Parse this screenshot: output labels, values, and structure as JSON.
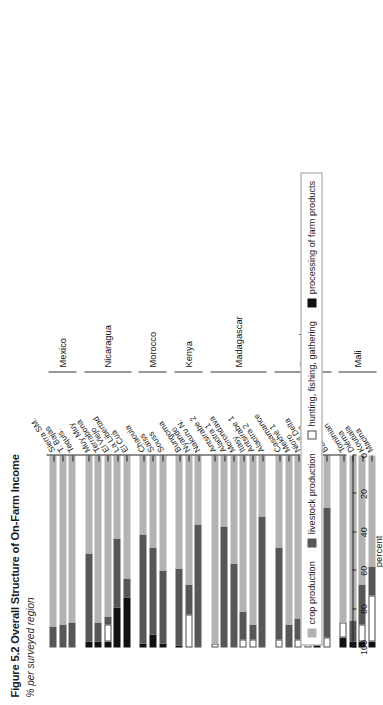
{
  "figure": {
    "title": "Figure 5.2  Overall Structure of On-Farm Income",
    "subtitle": "% per surveyed region"
  },
  "legend": {
    "items": [
      {
        "key": "crop",
        "label": "crop production",
        "color": "#b3b3b3"
      },
      {
        "key": "live",
        "label": "livestock production",
        "color": "#575757"
      },
      {
        "key": "hunt",
        "label": "hunting, fishing, gathering",
        "color": "#ffffff"
      },
      {
        "key": "proc",
        "label": "processing of farm products",
        "color": "#111111"
      }
    ]
  },
  "chart_data": {
    "type": "bar",
    "orientation": "horizontal-stacked",
    "title": "Figure 5.2  Overall Structure of On-Farm Income",
    "subtitle": "% per surveyed region",
    "xlabel": "percent",
    "ylabel": "",
    "xlim": [
      100,
      0
    ],
    "xticks": [
      100,
      80,
      60,
      40,
      20,
      0
    ],
    "x_axis_reversed": true,
    "grid": false,
    "legend_position": "bottom-left",
    "series": [
      {
        "name": "processing of farm products",
        "key": "proc",
        "color": "#111111"
      },
      {
        "name": "hunting, fishing, gathering",
        "key": "hunt",
        "color": "#ffffff"
      },
      {
        "name": "livestock production",
        "key": "live",
        "color": "#575757"
      },
      {
        "name": "crop production",
        "key": "crop",
        "color": "#b3b3b3"
      }
    ],
    "groups": [
      {
        "country": "Mexico",
        "regions": [
          {
            "label": "Sierra SM.",
            "proc": 0,
            "hunt": 0,
            "live": 11,
            "crop": 89
          },
          {
            "label": "T. Bajas",
            "proc": 0,
            "hunt": 0,
            "live": 12,
            "crop": 88
          },
          {
            "label": "Tequis.",
            "proc": 0,
            "hunt": 0,
            "live": 13,
            "crop": 87
          }
        ]
      },
      {
        "country": "Nicaragua",
        "regions": [
          {
            "label": "Muy Muy",
            "proc": 3,
            "hunt": 0,
            "live": 46,
            "crop": 51
          },
          {
            "label": "Terrabona",
            "proc": 3,
            "hunt": 0,
            "live": 10,
            "crop": 87
          },
          {
            "label": "El Viejo",
            "proc": 3,
            "hunt": 9,
            "live": 4,
            "crop": 84
          },
          {
            "label": "La Libertad",
            "proc": 21,
            "hunt": 0,
            "live": 36,
            "crop": 43
          },
          {
            "label": "El Cuá",
            "proc": 26,
            "hunt": 0,
            "live": 10,
            "crop": 64
          }
        ]
      },
      {
        "country": "Morocco",
        "regions": [
          {
            "label": "Chaouia",
            "proc": 2,
            "hunt": 0,
            "live": 57,
            "crop": 41
          },
          {
            "label": "Saïss",
            "proc": 7,
            "hunt": 0,
            "live": 45,
            "crop": 48
          },
          {
            "label": "Souss",
            "proc": 2,
            "hunt": 0,
            "live": 38,
            "crop": 60
          }
        ]
      },
      {
        "country": "Kenya",
        "regions": [
          {
            "label": "Bungoma",
            "proc": 1,
            "hunt": 0,
            "live": 40,
            "crop": 59
          },
          {
            "label": "Nyando",
            "proc": 0,
            "hunt": 17,
            "live": 16,
            "crop": 67
          },
          {
            "label": "Nakuru N.",
            "proc": 0,
            "hunt": 0,
            "live": 64,
            "crop": 36
          }
        ]
      },
      {
        "country": "Madagascar",
        "regions": [
          {
            "label": "Antsirabe 2",
            "proc": 0,
            "hunt": 2,
            "live": 0,
            "crop": 98
          },
          {
            "label": "Alaotra 1",
            "proc": 0,
            "hunt": 0,
            "live": 63,
            "crop": 37
          },
          {
            "label": "Morondava",
            "proc": 0,
            "hunt": 0,
            "live": 44,
            "crop": 56
          },
          {
            "label": "Itasy",
            "proc": 0,
            "hunt": 4,
            "live": 15,
            "crop": 81
          },
          {
            "label": "Antsirabe 1",
            "proc": 0,
            "hunt": 4,
            "live": 8,
            "crop": 88
          },
          {
            "label": "Alaotra 2",
            "proc": 0,
            "hunt": 0,
            "live": 68,
            "crop": 32
          }
        ]
      },
      {
        "country": "Senegal",
        "regions": [
          {
            "label": "Casamance",
            "proc": 0,
            "hunt": 4,
            "live": 48,
            "crop": 48
          },
          {
            "label": "Mekhé 1",
            "proc": 0,
            "hunt": 0,
            "live": 12,
            "crop": 88
          },
          {
            "label": "Nioro",
            "proc": 0,
            "hunt": 4,
            "live": 11,
            "crop": 85
          },
          {
            "label": "Haut Delta",
            "proc": 0,
            "hunt": 6,
            "live": 24,
            "crop": 70
          },
          {
            "label": "Mekhé 2",
            "proc": 13,
            "hunt": 0,
            "live": 41,
            "crop": 46
          },
          {
            "label": "Bas Delta",
            "proc": 0,
            "hunt": 5,
            "live": 68,
            "crop": 27
          }
        ]
      },
      {
        "country": "Mali",
        "regions": [
          {
            "label": "Tominian",
            "proc": 5,
            "hunt": 8,
            "live": 0,
            "crop": 87
          },
          {
            "label": "Diéma",
            "proc": 3,
            "hunt": 0,
            "live": 11,
            "crop": 86
          },
          {
            "label": "Koutiala",
            "proc": 3,
            "hunt": 9,
            "live": 21,
            "crop": 67
          },
          {
            "label": "Macina",
            "proc": 3,
            "hunt": 24,
            "live": 15,
            "crop": 58
          }
        ]
      }
    ]
  }
}
